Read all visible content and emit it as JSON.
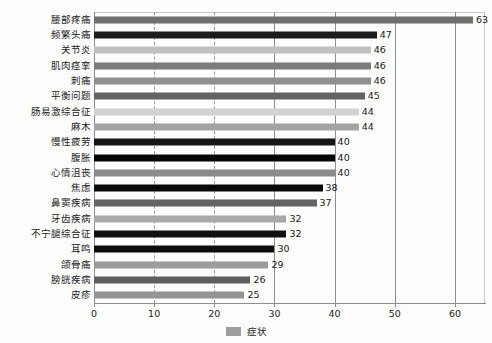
{
  "chart_data": {
    "type": "bar",
    "orientation": "horizontal",
    "title": "",
    "xlabel": "",
    "ylabel": "",
    "xlim": [
      0,
      65
    ],
    "grid": true,
    "legend_position": "bottom",
    "legend": [
      "症状"
    ],
    "series_name": "症状",
    "categories": [
      "腰部疼痛",
      "频繁头痛",
      "关节炎",
      "肌肉痉挛",
      "刺痛",
      "平衡问题",
      "肠易激综合征",
      "麻木",
      "慢性疲劳",
      "腹胀",
      "心情沮丧",
      "焦虑",
      "鼻窦疾病",
      "牙齿疾病",
      "不宁腿综合征",
      "耳鸣",
      "颌骨痛",
      "膀胱疾病",
      "皮疹"
    ],
    "values": [
      63,
      47,
      46,
      46,
      46,
      45,
      44,
      44,
      40,
      40,
      40,
      38,
      37,
      32,
      32,
      30,
      29,
      26,
      25
    ],
    "bar_colors": [
      "#6f6f6f",
      "#1c1c1c",
      "#c0c0c0",
      "#7b7b7b",
      "#8f8f8f",
      "#636363",
      "#d2d2d2",
      "#a3a3a3",
      "#161616",
      "#050505",
      "#8b8b8b",
      "#0a0a0a",
      "#636363",
      "#a8a8a8",
      "#101010",
      "#0d0d0d",
      "#9c9c9c",
      "#5f5f5f",
      "#949494"
    ],
    "xticks": [
      0,
      10,
      20,
      30,
      40,
      50,
      60
    ],
    "xtick_labels": [
      "0",
      "10",
      "20",
      "30",
      "40",
      "50",
      "60"
    ],
    "gridline_styles": [
      "none",
      "dashed",
      "dashed",
      "solid",
      "solid",
      "solid",
      "solid"
    ]
  },
  "legend": {
    "label": "症状",
    "swatch_color": "#9d9d9d"
  }
}
